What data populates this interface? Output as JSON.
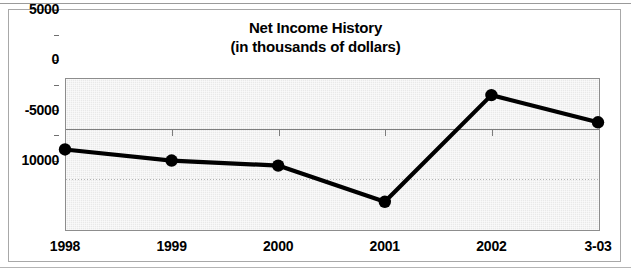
{
  "chart_data": {
    "type": "line",
    "title": "Net Income History",
    "subtitle": "(in thousands of dollars)",
    "xlabel": "",
    "ylabel": "",
    "categories": [
      "1998",
      "1999",
      "2000",
      "2001",
      "2002",
      "3-03"
    ],
    "series": [
      {
        "name": "Net Income",
        "values": [
          -2100,
          -3200,
          -3700,
          -7300,
          3300,
          600
        ]
      }
    ],
    "ylim": [
      -10000,
      5000
    ],
    "ytick_labels": [
      "5000",
      "0",
      "-5000",
      "10000"
    ],
    "ytick_values": [
      5000,
      0,
      -5000,
      -10000
    ],
    "yminor_tick_values": [
      2500,
      -2500,
      -7500
    ],
    "grid": true,
    "grid_axis": "y",
    "legend": false,
    "legend_position": "none",
    "marker": "filled-circle",
    "line_color": "#000000",
    "marker_color": "#000000",
    "plot_background": "#e9e9e9",
    "zero_line_color": "#7d7d7d",
    "gridline_color": "#9d9d9d"
  },
  "chart": {
    "title_line1": "Net Income History",
    "title_line2": "(in thousands of dollars)"
  }
}
